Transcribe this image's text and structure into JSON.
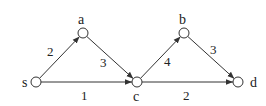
{
  "graph": {
    "nodes": [
      {
        "id": "s",
        "label": "s",
        "x": 36,
        "y": 82,
        "lx": 22,
        "ly": 87
      },
      {
        "id": "a",
        "label": "a",
        "x": 83,
        "y": 33,
        "lx": 78,
        "ly": 24
      },
      {
        "id": "c",
        "label": "c",
        "x": 137,
        "y": 82,
        "lx": 133,
        "ly": 101
      },
      {
        "id": "b",
        "label": "b",
        "x": 184,
        "y": 33,
        "lx": 179,
        "ly": 24
      },
      {
        "id": "d",
        "label": "d",
        "x": 238,
        "y": 82,
        "lx": 250,
        "ly": 87
      }
    ],
    "edges": [
      {
        "from": "s",
        "to": "a",
        "weight": "2",
        "wx": 47,
        "wy": 56
      },
      {
        "from": "s",
        "to": "c",
        "weight": "1",
        "wx": 81,
        "wy": 100
      },
      {
        "from": "a",
        "to": "c",
        "weight": "3",
        "wx": 100,
        "wy": 67
      },
      {
        "from": "c",
        "to": "b",
        "weight": "4",
        "wx": 164,
        "wy": 66
      },
      {
        "from": "c",
        "to": "d",
        "weight": "2",
        "wx": 183,
        "wy": 100
      },
      {
        "from": "b",
        "to": "d",
        "weight": "3",
        "wx": 210,
        "wy": 54
      }
    ],
    "colors": {
      "stroke": "#333333",
      "text": "#222222"
    }
  }
}
